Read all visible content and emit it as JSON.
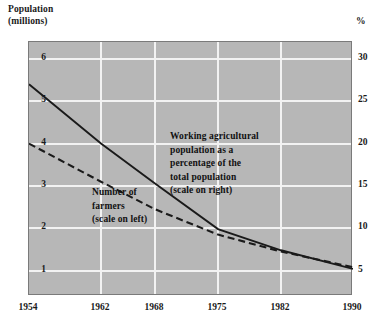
{
  "chart_data": {
    "type": "line",
    "title": "",
    "subtitle": "",
    "xlabel": "",
    "ylabel": "Population\n(millions)",
    "ylabel_right": "%",
    "grid": true,
    "legend_position": "inline-annotations",
    "x": [
      1954,
      1962,
      1968,
      1975,
      1982,
      1990
    ],
    "xticklabels": [
      "1954",
      "1962",
      "1968",
      "1975",
      "1982",
      "1990"
    ],
    "yticklabels_left": [
      "6",
      "5",
      "4",
      "3",
      "2",
      "1"
    ],
    "yticklabels_right": [
      "30",
      "25",
      "20",
      "15",
      "10",
      "5"
    ],
    "ylim_left": [
      0.4,
      6.4
    ],
    "ylim_right": [
      2,
      32
    ],
    "yticks_left": [
      6,
      5,
      4,
      3,
      2,
      1
    ],
    "yticks_right": [
      30,
      25,
      20,
      15,
      10,
      5
    ],
    "series": [
      {
        "name": "Working agricultural population as a percentage of the total population (scale on right)",
        "style": "solid",
        "axis": "right",
        "color": "#1a1a1a",
        "x": [
          1954,
          1962,
          1968,
          1975,
          1982,
          1990
        ],
        "values": [
          27.0,
          20.0,
          15.3,
          9.9,
          7.4,
          5.2
        ]
      },
      {
        "name": "Number of farmers (scale on left)",
        "style": "dashed",
        "axis": "left",
        "color": "#1a1a1a",
        "x": [
          1954,
          1962,
          1968,
          1975,
          1982,
          1990
        ],
        "values": [
          4.0,
          3.1,
          2.45,
          1.85,
          1.45,
          1.08
        ]
      }
    ],
    "annotations": [
      {
        "id": "annot-right",
        "text": "Working agricultural\npopulation as a\npercentage of the\ntotal population\n(scale on right)"
      },
      {
        "id": "annot-left",
        "text": "Number of\nfarmers\n(scale on left)"
      }
    ],
    "colors": {
      "plot_background": "#b7b7b7",
      "gridline": "#f2f2f2",
      "line": "#1a1a1a",
      "page_background": "#ffffff"
    }
  }
}
